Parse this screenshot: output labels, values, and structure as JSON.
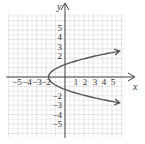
{
  "chart_data": {
    "type": "line",
    "title": "",
    "equation_hint": "parabola opening right, vertex near (-2, 0)",
    "xlabel": "x",
    "ylabel": "y",
    "xlim": [
      -6,
      6
    ],
    "ylim": [
      -6,
      6
    ],
    "grid": true,
    "x_ticks": [
      "-5",
      "-4",
      "-3",
      "-2",
      "1",
      "2",
      "3",
      "4",
      "5"
    ],
    "y_ticks": [
      "5",
      "4",
      "3",
      "2",
      "-2",
      "-3",
      "-4",
      "-5"
    ],
    "series": [
      {
        "name": "curve",
        "color": "#555555",
        "points": [
          [
            6,
            2.8
          ],
          [
            4,
            2.45
          ],
          [
            2,
            2
          ],
          [
            1,
            1.73
          ],
          [
            0,
            1.41
          ],
          [
            -1,
            1
          ],
          [
            -1.5,
            0.71
          ],
          [
            -2,
            0
          ],
          [
            -1.5,
            -0.71
          ],
          [
            -1,
            -1
          ],
          [
            0,
            -1.41
          ],
          [
            1,
            -1.73
          ],
          [
            2,
            -2
          ],
          [
            4,
            -2.45
          ],
          [
            6,
            -2.8
          ]
        ],
        "arrows": "both ends"
      }
    ]
  },
  "labels": {
    "x_axis": "x",
    "y_axis": "y",
    "xticks": [
      "−5",
      "−4",
      "−3",
      "−2",
      "1",
      "2",
      "3",
      "4",
      "5"
    ],
    "yticks_pos": [
      "5",
      "4",
      "3",
      "2"
    ],
    "yticks_neg": [
      "−2",
      "−3",
      "−4",
      "−5"
    ]
  },
  "colors": {
    "grid": "#dddddd",
    "axis": "#444444",
    "curve": "#555555"
  }
}
